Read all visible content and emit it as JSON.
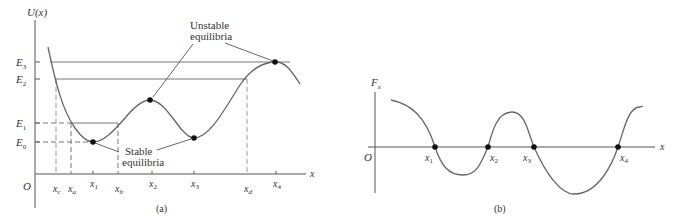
{
  "panel_a": {
    "caption": "(a)",
    "y_axis_label": "U(x)",
    "x_axis_label": "x",
    "origin_label": "O",
    "energy_levels": [
      {
        "label": "E",
        "sub": "3",
        "y": 62
      },
      {
        "label": "E",
        "sub": "2",
        "y": 79
      },
      {
        "label": "E",
        "sub": "1",
        "y": 123
      },
      {
        "label": "E",
        "sub": "0",
        "y": 142
      }
    ],
    "x_ticks": [
      {
        "label": "x",
        "sub": "c",
        "x": 56
      },
      {
        "label": "x",
        "sub": "a",
        "x": 71
      },
      {
        "label": "x",
        "sub": "1",
        "x": 93
      },
      {
        "label": "x",
        "sub": "b",
        "x": 118
      },
      {
        "label": "x",
        "sub": "2",
        "x": 152
      },
      {
        "label": "x",
        "sub": "3",
        "x": 194
      },
      {
        "label": "x",
        "sub": "d",
        "x": 247
      },
      {
        "label": "x",
        "sub": "4",
        "x": 276
      }
    ],
    "annotation_unstable_line1": "Unstable",
    "annotation_unstable_line2": "equilibria",
    "annotation_stable_line1": "Stable",
    "annotation_stable_line2": "equilibria"
  },
  "panel_b": {
    "caption": "(b)",
    "y_axis_label": "F",
    "y_axis_sub": "x",
    "x_axis_label": "x",
    "origin_label": "O",
    "zero_crossings": [
      {
        "label": "x",
        "sub": "1",
        "x": 435
      },
      {
        "label": "x",
        "sub": "2",
        "x": 488
      },
      {
        "label": "x",
        "sub": "3",
        "x": 534
      },
      {
        "label": "x",
        "sub": "4",
        "x": 618
      }
    ]
  },
  "colors": {
    "curve": "#666666",
    "axis": "#555555",
    "dot": "#111111",
    "dash": "#888888"
  }
}
